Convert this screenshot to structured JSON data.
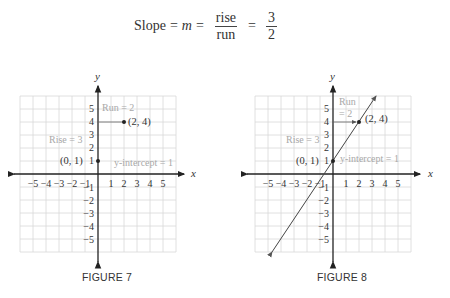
{
  "formula": {
    "lhs": "Slope",
    "eq1": "=",
    "m": "m",
    "eq2": "=",
    "rise": "rise",
    "run": "run",
    "eq3": "=",
    "num": "3",
    "den": "2"
  },
  "figures": [
    {
      "caption": "FIGURE 7",
      "x_label": "x",
      "y_label": "y",
      "x_ticks": [
        "−5",
        "−4",
        "−3",
        "−2",
        "−1",
        "1",
        "2",
        "3",
        "4",
        "5"
      ],
      "y_ticks_pos": [
        "5",
        "4",
        "3",
        "2",
        "1"
      ],
      "y_ticks_neg": [
        "−1",
        "−2",
        "−3",
        "−4",
        "−5"
      ],
      "point1_label": "(0, 1)",
      "point2_label": "(2, 4)",
      "run_label": "Run = 2",
      "rise_label": "Rise = 3",
      "intercept_label": "y-intercept = 1"
    },
    {
      "caption": "FIGURE 8",
      "x_label": "x",
      "y_label": "y",
      "x_ticks": [
        "−5",
        "−4",
        "−3",
        "−2",
        "−1",
        "1",
        "2",
        "3",
        "4",
        "5"
      ],
      "y_ticks_pos": [
        "5",
        "4",
        "3",
        "2",
        "1"
      ],
      "y_ticks_neg": [
        "−1",
        "−2",
        "−3",
        "−4",
        "−5"
      ],
      "point1_label": "(0, 1)",
      "point2_label": "(2, 4)",
      "run_label_line1": "Run",
      "run_label_line2": "= 2",
      "rise_label": "Rise = 3",
      "intercept_label": "y-intercept = 1"
    }
  ],
  "colors": {
    "grid": "#d8d8d8",
    "axis": "#222222",
    "annotation": "#a8a8a8",
    "line": "#444444"
  }
}
